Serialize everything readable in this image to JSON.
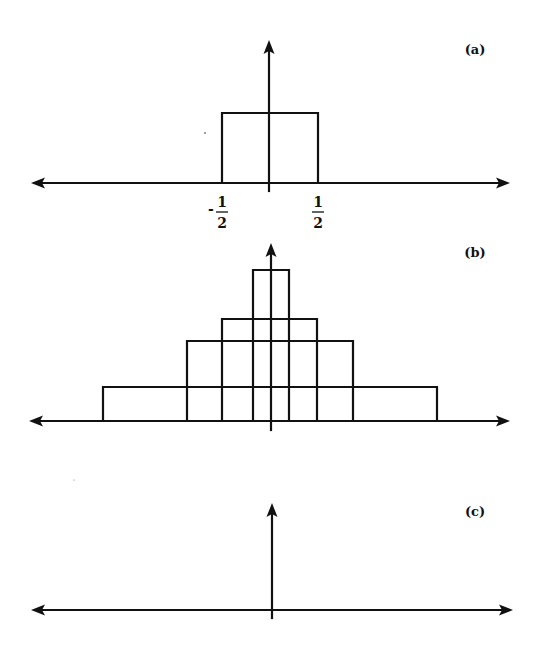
{
  "figure": {
    "background": "#ffffff",
    "ink_color": "#111111",
    "stroke_width": 2.2
  },
  "panels": [
    {
      "id": "a",
      "label": "(a)",
      "label_pos": [
        475,
        54
      ],
      "axis": {
        "y": 183,
        "x_left": 31,
        "x_right": 510,
        "v_x": 269,
        "v_top": 40,
        "v_bottom": 191
      },
      "rects": [
        {
          "x1": 222,
          "x2": 318,
          "top": 113
        }
      ],
      "ticks": [
        {
          "x": 222,
          "sign": "-",
          "num": "1",
          "den": "2"
        },
        {
          "x": 318,
          "sign": "",
          "num": "1",
          "den": "2"
        }
      ]
    },
    {
      "id": "b",
      "label": "(b)",
      "label_pos": [
        475,
        257
      ],
      "axis": {
        "y": 421,
        "x_left": 29,
        "x_right": 510,
        "v_x": 271,
        "v_top": 243,
        "v_bottom": 430
      },
      "rects": [
        {
          "x1": 253,
          "x2": 289,
          "top": 270
        },
        {
          "x1": 222,
          "x2": 317,
          "top": 319
        },
        {
          "x1": 187,
          "x2": 353,
          "top": 341
        },
        {
          "x1": 103,
          "x2": 437,
          "top": 387
        }
      ],
      "ticks": []
    },
    {
      "id": "c",
      "label": "(c)",
      "label_pos": [
        475,
        516
      ],
      "axis": {
        "y": 610,
        "x_left": 31,
        "x_right": 513,
        "v_x": 272,
        "v_top": 503,
        "v_bottom": 618
      },
      "rects": [],
      "ticks": []
    }
  ],
  "specks": [
    [
      205,
      133,
      0.9
    ],
    [
      74,
      480,
      0.6
    ]
  ],
  "chart_data": [
    {
      "type": "diagram",
      "title": "(a)",
      "description": "Unit rectangular pulse of width 1 centered at origin",
      "x_ticks": [
        "-1/2",
        "1/2"
      ],
      "pulses": [
        {
          "from": -0.5,
          "to": 0.5,
          "height": 1
        }
      ]
    },
    {
      "type": "diagram",
      "title": "(b)",
      "description": "Family of nested rectangular pulses of equal area, narrower ones taller",
      "pulses": [
        {
          "width_rel": 0.375,
          "height_rel": 1.0
        },
        {
          "width_rel": 1.0,
          "height_rel": 0.68
        },
        {
          "width_rel": 1.73,
          "height_rel": 0.54
        },
        {
          "width_rel": 3.48,
          "height_rel": 0.22
        }
      ]
    },
    {
      "type": "diagram",
      "title": "(c)",
      "description": "Limit: impulse (delta function) drawn as vertical arrow at origin"
    }
  ]
}
